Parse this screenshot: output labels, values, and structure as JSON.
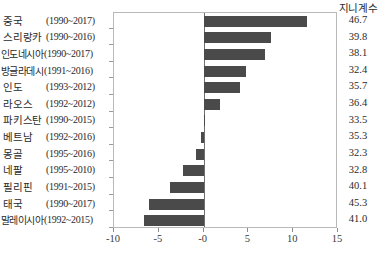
{
  "chart_data": {
    "type": "bar",
    "orientation": "horizontal",
    "title": "",
    "xlabel": "",
    "ylabel": "",
    "xlim": [
      -10,
      15
    ],
    "xticks": [
      -10,
      -5,
      0,
      5,
      10,
      15
    ],
    "xtick_labels": [
      "-10",
      "-5",
      "-0",
      "5",
      "10",
      "15"
    ],
    "grid": false,
    "legend": false,
    "bar_color": "#4a4a4a",
    "value_column_header": "지니계수",
    "categories": [
      "중국",
      "스리랑카",
      "인도네시아",
      "방글라데시",
      "인도",
      "라오스",
      "파키스탄",
      "베트남",
      "몽골",
      "네팔",
      "필리핀",
      "태국",
      "말레이시아"
    ],
    "period_labels": [
      "(1990~2017)",
      "(1990~2016)",
      "(1990~2017)",
      "(1991~2016)",
      "(1993~2012)",
      "(1992~2012)",
      "(1990~2015)",
      "(1992~2016)",
      "(1995~2016)",
      "(1995~2010)",
      "(1991~2015)",
      "(1990~2017)",
      "(1992~2015)"
    ],
    "values": [
      11.5,
      7.5,
      6.9,
      4.7,
      4.1,
      1.8,
      0.2,
      -0.3,
      -0.9,
      -2.3,
      -3.7,
      -6.1,
      -6.7
    ],
    "gini_values": [
      "46.7",
      "39.8",
      "38.1",
      "32.4",
      "35.7",
      "36.4",
      "33.5",
      "35.3",
      "32.3",
      "32.8",
      "40.1",
      "45.3",
      "41.0"
    ],
    "rows": [
      {
        "country": "중국",
        "period": "(1990~2017)",
        "value": 11.5,
        "gini": "46.7"
      },
      {
        "country": "스리랑카",
        "period": "(1990~2016)",
        "value": 7.5,
        "gini": "39.8"
      },
      {
        "country": "인도네시아",
        "period": "(1990~2017)",
        "value": 6.9,
        "gini": "38.1"
      },
      {
        "country": "방글라데시",
        "period": "(1991~2016)",
        "value": 4.7,
        "gini": "32.4"
      },
      {
        "country": "인도",
        "period": "(1993~2012)",
        "value": 4.1,
        "gini": "35.7"
      },
      {
        "country": "라오스",
        "period": "(1992~2012)",
        "value": 1.8,
        "gini": "36.4"
      },
      {
        "country": "파키스탄",
        "period": "(1990~2015)",
        "value": 0.2,
        "gini": "33.5"
      },
      {
        "country": "베트남",
        "period": "(1992~2016)",
        "value": -0.3,
        "gini": "35.3"
      },
      {
        "country": "몽골",
        "period": "(1995~2016)",
        "value": -0.9,
        "gini": "32.3"
      },
      {
        "country": "네팔",
        "period": "(1995~2010)",
        "value": -2.3,
        "gini": "32.8"
      },
      {
        "country": "필리핀",
        "period": "(1991~2015)",
        "value": -3.7,
        "gini": "40.1"
      },
      {
        "country": "태국",
        "period": "(1990~2017)",
        "value": -6.1,
        "gini": "45.3"
      },
      {
        "country": "말레이시아",
        "period": "(1992~2015)",
        "value": -6.7,
        "gini": "41.0"
      }
    ]
  }
}
